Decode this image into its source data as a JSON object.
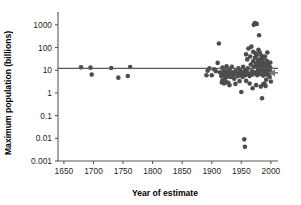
{
  "chart_data": {
    "type": "scatter",
    "title": "",
    "xlabel": "Year of estimate",
    "ylabel": "Maximum population (billions)",
    "xlim": [
      1640,
      2012
    ],
    "ylim": [
      0.001,
      3000
    ],
    "yscale": "log",
    "xscale": "linear",
    "grid": false,
    "legend": null,
    "xticks": [
      1650,
      1700,
      1750,
      1800,
      1850,
      1900,
      1950,
      2000
    ],
    "xtick_labels": [
      "1650",
      "1700",
      "1750",
      "1800",
      "1850",
      "1900",
      "1950",
      "2000"
    ],
    "yticks": [
      1000,
      100,
      10,
      1,
      0.1,
      0.01,
      0.001
    ],
    "ytick_labels": [
      "1000",
      "100",
      "10",
      "1",
      "0.1",
      "0.01",
      "0.001"
    ],
    "annotations": [
      {
        "name": "reference-line",
        "kind": "hline",
        "y": 12,
        "label": "horizontal reference line at about 12 billion"
      },
      {
        "name": "right-arrow-marker",
        "kind": "arrow",
        "y": 7.7,
        "x_from": 2012,
        "x_to": 1996,
        "label": "arrow pointing to current estimate cluster"
      }
    ],
    "points": [
      [
        1679,
        13.4
      ],
      [
        1695,
        13.0
      ],
      [
        1697,
        6.4
      ],
      [
        1730,
        12.6
      ],
      [
        1742,
        4.7
      ],
      [
        1758,
        5.6
      ],
      [
        1762,
        13.8
      ],
      [
        1891,
        6.0
      ],
      [
        1893,
        9.5
      ],
      [
        1896,
        12.0
      ],
      [
        1900,
        6.0
      ],
      [
        1904,
        11.0
      ],
      [
        1907,
        9.0
      ],
      [
        1910,
        21.0
      ],
      [
        1912,
        150.0
      ],
      [
        1914,
        8.0
      ],
      [
        1916,
        5.5
      ],
      [
        1917,
        2.9
      ],
      [
        1918,
        13.0
      ],
      [
        1919,
        7.5
      ],
      [
        1920,
        11.0
      ],
      [
        1921,
        8.3
      ],
      [
        1922,
        6.0
      ],
      [
        1923,
        4.5
      ],
      [
        1924,
        3.0
      ],
      [
        1925,
        15.0
      ],
      [
        1925,
        7.0
      ],
      [
        1926,
        5.2
      ],
      [
        1927,
        9.0
      ],
      [
        1928,
        2.8
      ],
      [
        1929,
        6.5
      ],
      [
        1930,
        11.0
      ],
      [
        1931,
        7.3
      ],
      [
        1932,
        5.0
      ],
      [
        1934,
        14.0
      ],
      [
        1935,
        8.0
      ],
      [
        1936,
        6.0
      ],
      [
        1938,
        4.2
      ],
      [
        1940,
        9.0
      ],
      [
        1942,
        6.8
      ],
      [
        1944,
        5.4
      ],
      [
        1945,
        12.0
      ],
      [
        1946,
        7.6
      ],
      [
        1947,
        3.3
      ],
      [
        1948,
        9.5
      ],
      [
        1949,
        6.2
      ],
      [
        1950,
        1.1
      ],
      [
        1951,
        8.0
      ],
      [
        1952,
        5.0
      ],
      [
        1953,
        14.0
      ],
      [
        1954,
        7.0
      ],
      [
        1955,
        0.009
      ],
      [
        1956,
        0.0042
      ],
      [
        1956,
        10.0
      ],
      [
        1957,
        6.0
      ],
      [
        1958,
        50.0
      ],
      [
        1959,
        8.5
      ],
      [
        1960,
        30.0
      ],
      [
        1961,
        12.0
      ],
      [
        1962,
        90.0
      ],
      [
        1963,
        7.0
      ],
      [
        1964,
        5.5
      ],
      [
        1965,
        40.0
      ],
      [
        1966,
        18.0
      ],
      [
        1967,
        110.0
      ],
      [
        1968,
        9.0
      ],
      [
        1969,
        6.5
      ],
      [
        1970,
        65.0
      ],
      [
        1970,
        25.0
      ],
      [
        1971,
        1000.0
      ],
      [
        1971,
        14.0
      ],
      [
        1972,
        8.0
      ],
      [
        1973,
        1200.0
      ],
      [
        1973,
        35.0
      ],
      [
        1974,
        55.0
      ],
      [
        1975,
        20.0
      ],
      [
        1975,
        7.5
      ],
      [
        1976,
        1100.0
      ],
      [
        1976,
        45.0
      ],
      [
        1977,
        16.0
      ],
      [
        1977,
        6.0
      ],
      [
        1978,
        28.0
      ],
      [
        1978,
        10.0
      ],
      [
        1979,
        80.0
      ],
      [
        1979,
        13.0
      ],
      [
        1980,
        350.0
      ],
      [
        1980,
        22.0
      ],
      [
        1980,
        8.0
      ],
      [
        1981,
        60.0
      ],
      [
        1981,
        11.0
      ],
      [
        1982,
        30.0
      ],
      [
        1982,
        6.8
      ],
      [
        1983,
        18.0
      ],
      [
        1983,
        9.5
      ],
      [
        1984,
        44.0
      ],
      [
        1984,
        12.0
      ],
      [
        1985,
        0.58
      ],
      [
        1985,
        24.0
      ],
      [
        1985,
        7.2
      ],
      [
        1986,
        15.0
      ],
      [
        1986,
        9.0
      ],
      [
        1987,
        33.0
      ],
      [
        1987,
        5.8
      ],
      [
        1988,
        20.0
      ],
      [
        1988,
        11.0
      ],
      [
        1989,
        2.6
      ],
      [
        1989,
        13.5
      ],
      [
        1990,
        40.0
      ],
      [
        1990,
        8.4
      ],
      [
        1991,
        17.0
      ],
      [
        1991,
        10.5
      ],
      [
        1992,
        7.0
      ],
      [
        1992,
        14.0
      ],
      [
        1993,
        26.0
      ],
      [
        1993,
        9.2
      ],
      [
        1994,
        12.5
      ],
      [
        1994,
        6.2
      ],
      [
        1995,
        19.0
      ],
      [
        1995,
        8.8
      ],
      [
        1996,
        11.5
      ],
      [
        1996,
        7.6
      ],
      [
        1997,
        10.0
      ],
      [
        1997,
        15.0
      ],
      [
        1998,
        9.0
      ],
      [
        1998,
        5.0
      ],
      [
        1999,
        13.0
      ],
      [
        1999,
        8.0
      ],
      [
        2000,
        3.2
      ],
      [
        1999,
        22.0
      ],
      [
        1994,
        60.0
      ],
      [
        1992,
        3.8
      ],
      [
        1987,
        2.4
      ],
      [
        1975,
        2.2
      ],
      [
        1964,
        2.6
      ],
      [
        1958,
        3.4
      ],
      [
        1940,
        2.5
      ],
      [
        1930,
        2.2
      ],
      [
        1921,
        2.6
      ],
      [
        1918,
        3.6
      ],
      [
        1983,
        1.9
      ],
      [
        1991,
        2.0
      ],
      [
        1969,
        1.6
      ]
    ]
  },
  "colors": {
    "point": "#4d4d50",
    "axis": "#58585b",
    "arrow": "#7a7a7d",
    "text": "#231f20",
    "background": "#ffffff"
  }
}
